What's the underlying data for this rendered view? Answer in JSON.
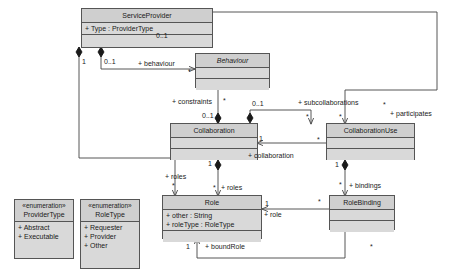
{
  "diagram": {
    "background": "#ffffff",
    "class_fill": "#d9d9d9",
    "header_fill": "#cfcfcf",
    "line_color": "#555555"
  },
  "classes": {
    "service_provider": {
      "name": "ServiceProvider",
      "attributes": [
        "+ Type : ProviderType"
      ]
    },
    "behaviour": {
      "name": "Behaviour",
      "attributes": []
    },
    "collaboration": {
      "name": "Collaboration",
      "attributes": []
    },
    "collaboration_use": {
      "name": "CollaborationUse",
      "attributes": []
    },
    "role": {
      "name": "Role",
      "attributes": [
        "+ other : String",
        "+ roleType : RoleType"
      ]
    },
    "role_binding": {
      "name": "RoleBinding",
      "attributes": []
    }
  },
  "enumerations": {
    "provider_type": {
      "stereotype": "«enumeration»",
      "name": "ProviderType",
      "literals": [
        "+ Abstract",
        "+ Executable"
      ]
    },
    "role_type": {
      "stereotype": "«enumeration»",
      "name": "RoleType",
      "literals": [
        "+ Requester",
        "+ Provider",
        "+ Other"
      ]
    }
  },
  "associations": {
    "behaviour_role": {
      "label": "+ behaviour"
    },
    "constraints_role": {
      "label": "+ constraints"
    },
    "subcollaborations_role": {
      "label": "+ subcollaborations"
    },
    "participates_role": {
      "label": "+ participates"
    },
    "collaboration_role": {
      "label": "+ collaboration"
    },
    "roles_left_role": {
      "label": "+ roles"
    },
    "roles_right_role": {
      "label": "+ roles"
    },
    "bindings_role": {
      "label": "+ bindings"
    },
    "role_role": {
      "label": "+ role"
    },
    "boundrole_role": {
      "label": "+ boundRole"
    }
  },
  "multiplicities": {
    "sp_behaviour_src": "0..1",
    "sp_type_src": "0..1",
    "sp_roles_src": "1",
    "behaviour_tgt": "*",
    "constraints_tgt": "*",
    "collaboration_constraints_src": "0..1",
    "collaboration_sub_src": "0..1",
    "subcollaborations_tgt": "*",
    "participates_src": "*",
    "participates_tgt": "*",
    "collaboration_bottom": "1",
    "collaboration_right": "1",
    "collaboration_use_left": "*",
    "collaboration_use_bottom": "1",
    "roles_left_tgt": "*",
    "roles_right_tgt": "*",
    "bindings_src": "*",
    "bindings_tgt": "*",
    "role_binding_left": "*",
    "role_src": "1",
    "boundrole_src": "1",
    "boundrole_tgt": "*"
  }
}
